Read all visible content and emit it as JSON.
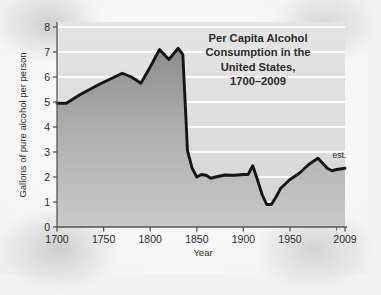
{
  "figure": {
    "background_color": "#f5f5f5",
    "line_color": "#111111",
    "fill_top_color": "#8a8a8a",
    "fill_bottom_color": "#c6c6c6",
    "gridline_color": "#ffffff",
    "axis_color": "#4a4a4a"
  },
  "chart_data": {
    "type": "area",
    "title_lines": [
      "Per Capita Alcohol",
      "Consumption in the",
      "United States,",
      "1700–2009"
    ],
    "xlabel": "Year",
    "ylabel": "Gallons of pure alcohol per person",
    "xlim": [
      1700,
      2009
    ],
    "ylim": [
      0,
      8.3
    ],
    "grid": true,
    "grid_axis": "y",
    "legend": false,
    "y_ticks": [
      0,
      1,
      2,
      3,
      4,
      5,
      6,
      7,
      8
    ],
    "y_tick_labels": [
      "0",
      "1",
      "2",
      "3",
      "4",
      "5",
      "6",
      "7",
      "8"
    ],
    "x_ticks": [
      1700,
      1750,
      1800,
      1850,
      1900,
      1950,
      2009
    ],
    "x_tick_labels": [
      "1700",
      "1750",
      "1800",
      "1850",
      "1900",
      "1950",
      "2009"
    ],
    "x_minor_ticks": [
      2000
    ],
    "annotations": [
      {
        "text": "est.",
        "x": 2003,
        "y": 2.75,
        "name": "estimate-note"
      }
    ],
    "series": [
      {
        "name": "Per capita alcohol consumption",
        "units": "gallons of pure alcohol per person",
        "x": [
          1700,
          1710,
          1725,
          1745,
          1770,
          1780,
          1790,
          1800,
          1810,
          1820,
          1830,
          1835,
          1840,
          1845,
          1850,
          1855,
          1860,
          1865,
          1870,
          1880,
          1890,
          1900,
          1905,
          1910,
          1915,
          1920,
          1925,
          1930,
          1935,
          1940,
          1950,
          1960,
          1970,
          1980,
          1990,
          1995,
          2000,
          2009
        ],
        "y": [
          4.95,
          4.95,
          5.3,
          5.7,
          6.15,
          6.0,
          5.75,
          6.4,
          7.1,
          6.7,
          7.15,
          6.9,
          3.05,
          2.35,
          2.0,
          2.1,
          2.07,
          1.95,
          2.0,
          2.08,
          2.07,
          2.1,
          2.1,
          2.45,
          1.9,
          1.3,
          0.9,
          0.9,
          1.2,
          1.55,
          1.9,
          2.15,
          2.5,
          2.75,
          2.35,
          2.25,
          2.3,
          2.35
        ]
      }
    ]
  }
}
